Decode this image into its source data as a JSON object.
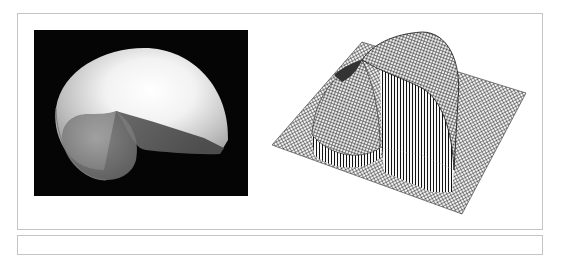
{
  "figure": {
    "left_panel": {
      "description": "shaded 3D nautilus shell on black background",
      "background_color": "#050505"
    },
    "right_panel": {
      "description": "3D wireframe mesh surface plot on flat grid",
      "line_color": "#222222"
    },
    "frame_border_color": "#c4c4c4"
  }
}
